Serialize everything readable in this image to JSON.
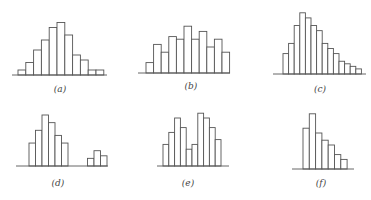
{
  "chart_data": [
    {
      "type": "bar",
      "panel": "a",
      "label": "(a)",
      "shape": "symmetric unimodal",
      "values": [
        2,
        5,
        10,
        14,
        19,
        21,
        16,
        8,
        6,
        2,
        2
      ]
    },
    {
      "type": "bar",
      "panel": "b",
      "label": "(b)",
      "shape": "broad multimodal",
      "values": [
        4,
        11,
        8,
        14,
        13,
        18,
        13,
        16,
        10,
        13,
        8
      ]
    },
    {
      "type": "bar",
      "panel": "c",
      "label": "(c)",
      "shape": "right-skewed",
      "values": [
        8,
        12,
        19,
        24,
        22,
        19,
        17,
        12,
        10,
        8,
        5,
        4,
        3,
        2
      ]
    },
    {
      "type": "bar",
      "panel": "d",
      "label": "(d)",
      "shape": "unimodal with outlier group",
      "values": [
        9,
        14,
        20,
        17,
        12,
        9,
        0,
        0,
        0,
        3,
        6,
        4
      ]
    },
    {
      "type": "bar",
      "panel": "e",
      "label": "(e)",
      "shape": "bimodal",
      "values": [
        9,
        14,
        20,
        16,
        7,
        9,
        22,
        20,
        16,
        11
      ]
    },
    {
      "type": "bar",
      "panel": "f",
      "label": "(f)",
      "shape": "right-skewed (truncated left)",
      "values": [
        17,
        23,
        15,
        12,
        10,
        6,
        4
      ]
    }
  ],
  "labels": {
    "a": "(a)",
    "b": "(b)",
    "c": "(c)",
    "d": "(d)",
    "e": "(e)",
    "f": "(f)"
  }
}
